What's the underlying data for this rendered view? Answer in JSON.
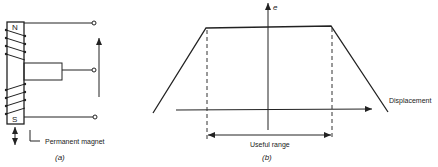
{
  "figure_a": {
    "pole_north": "N",
    "pole_south": "S",
    "magnet_label": "Permanent magnet",
    "caption": "(a)"
  },
  "figure_b": {
    "y_axis_label": "e",
    "x_axis_label": "Displacement",
    "range_label": "Useful range",
    "caption": "(b)"
  },
  "colors": {
    "ink": "#222222",
    "background": "#ffffff"
  }
}
